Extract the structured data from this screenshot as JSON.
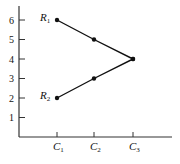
{
  "chart_data": {
    "type": "line",
    "title": "",
    "xlabel": "",
    "ylabel": "",
    "categories": [
      "C1",
      "C2",
      "C3"
    ],
    "category_display": [
      {
        "main": "C",
        "sub": "1"
      },
      {
        "main": "C",
        "sub": "2"
      },
      {
        "main": "C",
        "sub": "3"
      }
    ],
    "series": [
      {
        "name": "R1",
        "display": {
          "main": "R",
          "sub": "1"
        },
        "values": [
          6,
          5,
          4
        ]
      },
      {
        "name": "R2",
        "display": {
          "main": "R",
          "sub": "2"
        },
        "values": [
          2,
          3,
          4
        ]
      }
    ],
    "yticks": [
      1,
      2,
      3,
      4,
      5,
      6
    ],
    "ylim": [
      0,
      7
    ],
    "grid": false,
    "legend": "inline labels at left end of each line",
    "colors": {
      "line": "#111111",
      "axis": "#333333",
      "marker": "#111111"
    }
  }
}
